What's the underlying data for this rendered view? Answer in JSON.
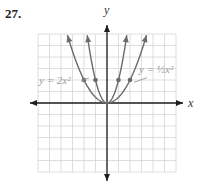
{
  "problem_number": "27.",
  "chart_data": {
    "type": "line",
    "title": "",
    "xlabel": "x",
    "ylabel": "y",
    "grid": true,
    "xlim": [
      -6,
      6
    ],
    "ylim": [
      -6,
      6
    ],
    "series": [
      {
        "name": "y = 2x^2",
        "label_text": "y = 2x²",
        "function": "2*x^2",
        "marked_points": [
          [
            -1,
            2
          ],
          [
            1,
            2
          ]
        ]
      },
      {
        "name": "y = 1/2 x^2",
        "label_text": "y = ½x²",
        "function": "0.5*x^2",
        "marked_points": [
          [
            -2,
            2
          ],
          [
            2,
            2
          ]
        ]
      }
    ]
  },
  "colors": {
    "curve": "#6b6b6b",
    "axis": "#1e1e1e",
    "grid": "#d6d6d6",
    "label": "#9a9a9a"
  }
}
